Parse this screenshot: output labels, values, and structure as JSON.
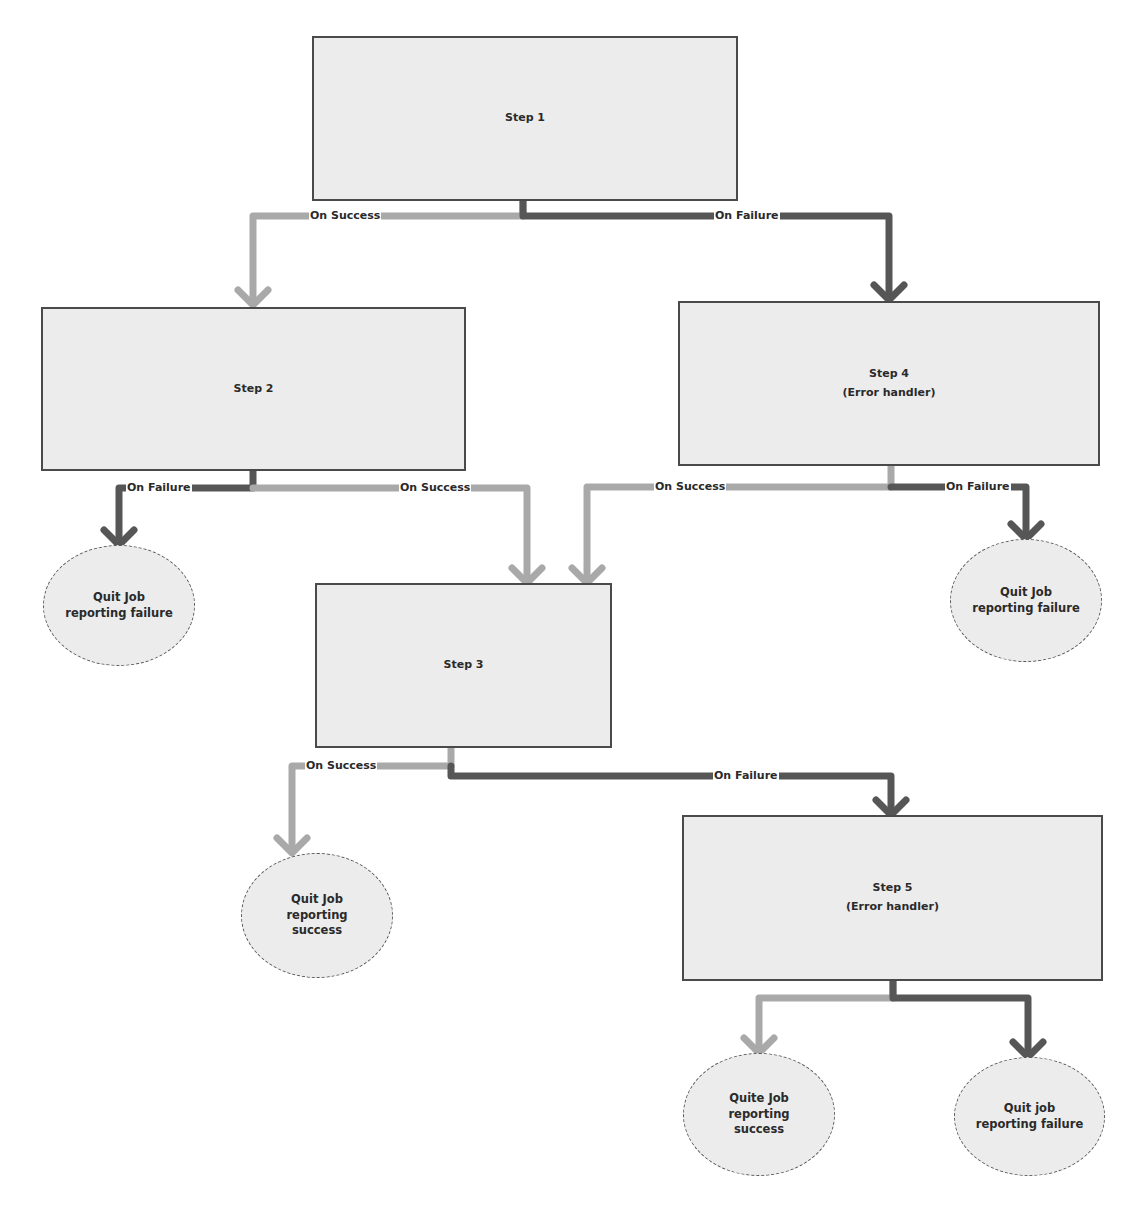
{
  "diagram": {
    "type": "flowchart",
    "colors": {
      "success_line": "#a9a9a9",
      "failure_line": "#565656",
      "node_fill": "#ececec",
      "node_border": "#4a4a4a"
    },
    "nodes": {
      "step1": {
        "title": "Step 1"
      },
      "step2": {
        "title": "Step 2"
      },
      "step3": {
        "title": "Step 3"
      },
      "step4": {
        "title": "Step 4",
        "subtitle": "(Error handler)"
      },
      "step5": {
        "title": "Step 5",
        "subtitle": "(Error handler)"
      },
      "quit_step2_failure": {
        "line1": "Quit Job",
        "line2": "reporting failure"
      },
      "quit_step4_failure": {
        "line1": "Quit Job",
        "line2": "reporting failure"
      },
      "quit_step3_success": {
        "line1": "Quit Job",
        "line2": "reporting",
        "line3": "success"
      },
      "quit_step5_success": {
        "line1": "Quite Job",
        "line2": "reporting",
        "line3": "success"
      },
      "quit_step5_failure": {
        "line1": "Quit job",
        "line2": "reporting failure"
      }
    },
    "edges": {
      "step1_success": {
        "label": "On Success",
        "from": "Step 1",
        "to": "Step 2"
      },
      "step1_failure": {
        "label": "On Failure",
        "from": "Step 1",
        "to": "Step 4"
      },
      "step2_failure": {
        "label": "On Failure",
        "from": "Step 2",
        "to": "Quit Job reporting failure"
      },
      "step2_success": {
        "label": "On Success",
        "from": "Step 2",
        "to": "Step 3"
      },
      "step4_success": {
        "label": "On Success",
        "from": "Step 4",
        "to": "Step 3"
      },
      "step4_failure": {
        "label": "On Failure",
        "from": "Step 4",
        "to": "Quit Job reporting failure"
      },
      "step3_success": {
        "label": "On Success",
        "from": "Step 3",
        "to": "Quit Job reporting success"
      },
      "step3_failure": {
        "label": "On Failure",
        "from": "Step 3",
        "to": "Step 5"
      },
      "step5_success": {
        "label": "",
        "from": "Step 5",
        "to": "Quite Job reporting success"
      },
      "step5_failure": {
        "label": "",
        "from": "Step 5",
        "to": "Quit job reporting failure"
      }
    }
  }
}
